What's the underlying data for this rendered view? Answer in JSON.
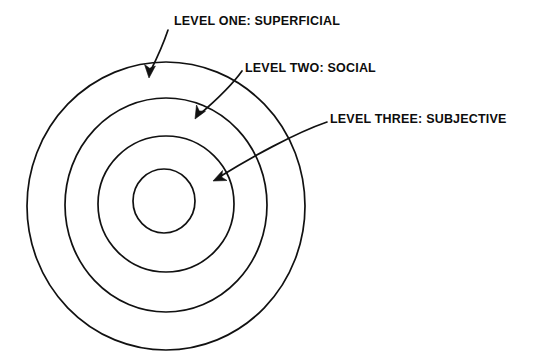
{
  "figure": {
    "background_color": "#ffffff",
    "stroke_color": "#111111",
    "text_color": "#0d0d0d"
  },
  "labels": {
    "level_one": "LEVEL ONE: SUPERFICIAL",
    "level_two": "LEVEL TWO: SOCIAL",
    "level_three": "LEVEL THREE: SUBJECTIVE"
  },
  "chart_data": {
    "type": "diagram",
    "shape": "concentric-circles",
    "title": "",
    "rings": [
      {
        "name": "level-one-outer-ring",
        "label": "LEVEL ONE: SUPERFICIAL",
        "cx": 166,
        "cy": 206,
        "rx": 139,
        "ry": 144
      },
      {
        "name": "level-two-ring",
        "label": "LEVEL TWO: SOCIAL",
        "cx": 166,
        "cy": 205,
        "rx": 101,
        "ry": 107
      },
      {
        "name": "level-three-ring",
        "label": "LEVEL THREE: SUBJECTIVE",
        "cx": 166,
        "cy": 204,
        "rx": 68,
        "ry": 68
      },
      {
        "name": "core-circle",
        "label": "",
        "cx": 164,
        "cy": 201,
        "rx": 31,
        "ry": 32
      }
    ],
    "annotations": [
      {
        "name": "arrow-level-one",
        "text": "LEVEL ONE: SUPERFICIAL",
        "from": [
          168,
          30
        ],
        "to": [
          149,
          76
        ]
      },
      {
        "name": "arrow-level-two",
        "text": "LEVEL TWO: SOCIAL",
        "from": [
          241,
          72
        ],
        "to": [
          196,
          118
        ]
      },
      {
        "name": "arrow-level-three",
        "text": "LEVEL THREE: SUBJECTIVE",
        "from": [
          326,
          123
        ],
        "to": [
          214,
          180
        ]
      }
    ]
  }
}
